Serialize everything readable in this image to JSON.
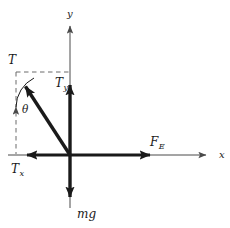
{
  "figure": {
    "type": "free-body-force-diagram",
    "background_color": "#ffffff",
    "stroke_color": "#1a1a1a",
    "axis_color": "#4a4a4a",
    "dash_color": "#6a6a6a"
  },
  "axes": {
    "origin": {
      "x": 70,
      "y": 155
    },
    "x_axis": {
      "label": "x",
      "from_x": 8,
      "to_x": 212,
      "y": 155
    },
    "y_axis": {
      "label": "y",
      "x": 70,
      "from_y": 208,
      "to_y": 20
    }
  },
  "vectors": [
    {
      "name": "tension",
      "label": "T",
      "subscript": "",
      "description": "resultant tension vector pointing up and to the left from the origin",
      "tail": {
        "x": 70,
        "y": 155
      },
      "tip": {
        "x": 18,
        "y": 75
      },
      "label_position": {
        "x": 8,
        "y": 54
      },
      "style": "thick-solid"
    },
    {
      "name": "tension-y-component",
      "label": "T",
      "subscript": "y",
      "description": "vertical component of tension pointing up along the y axis",
      "tail": {
        "x": 70,
        "y": 155
      },
      "tip": {
        "x": 70,
        "y": 74
      },
      "label_position": {
        "x": 55,
        "y": 77
      },
      "style": "thick-solid"
    },
    {
      "name": "tension-x-component",
      "label": "T",
      "subscript": "x",
      "description": "horizontal component of tension pointing left along the x axis",
      "tail": {
        "x": 70,
        "y": 155
      },
      "tip": {
        "x": 16,
        "y": 155
      },
      "label_position": {
        "x": 11,
        "y": 163
      },
      "style": "thick-solid"
    },
    {
      "name": "electric-force",
      "label": "F",
      "subscript": "E",
      "description": "electric force pointing right along the positive x axis",
      "tail": {
        "x": 70,
        "y": 155
      },
      "tip": {
        "x": 161,
        "y": 155
      },
      "label_position": {
        "x": 150,
        "y": 136
      },
      "style": "thick-solid"
    },
    {
      "name": "weight",
      "label": "mg",
      "subscript": "",
      "description": "weight of the object pointing down along the negative y axis",
      "tail": {
        "x": 70,
        "y": 155
      },
      "tip": {
        "x": 70,
        "y": 208
      },
      "label_position": {
        "x": 77,
        "y": 208
      },
      "style": "thick-solid"
    }
  ],
  "angle": {
    "name": "theta",
    "label": "θ",
    "description": "angle between the vertical dashed construction line and the tension vector",
    "vertex": {
      "x": 18,
      "y": 75
    },
    "label_position": {
      "x": 22,
      "y": 104
    }
  },
  "construction_lines": [
    {
      "name": "horizontal-dashed-guide",
      "description": "dashed line from tension tip horizontally to the y axis",
      "from": {
        "x": 16,
        "y": 72
      },
      "to": {
        "x": 70,
        "y": 72
      }
    },
    {
      "name": "vertical-dashed-guide",
      "description": "dashed line from tension tip vertically down to the x axis",
      "from": {
        "x": 16,
        "y": 72
      },
      "to": {
        "x": 16,
        "y": 154
      }
    }
  ]
}
